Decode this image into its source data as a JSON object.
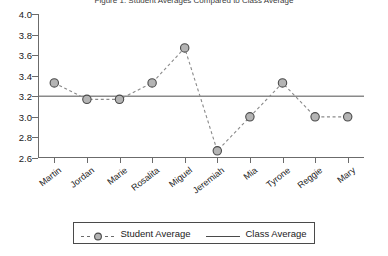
{
  "chart_data": {
    "type": "line",
    "title": "Figure 1. Student Averages Compared to Class Average",
    "categories": [
      "Martin",
      "Jordan",
      "Marie",
      "Rosalita",
      "Miguel",
      "Jeremiah",
      "Mia",
      "Tyrone",
      "Reggie",
      "Mary"
    ],
    "series": [
      {
        "name": "Student Average",
        "style": "dashed-marker",
        "values": [
          3.33,
          3.17,
          3.17,
          3.33,
          3.67,
          2.67,
          3.0,
          3.33,
          3.0,
          3.0
        ]
      },
      {
        "name": "Class Average",
        "style": "solid-line",
        "value": 3.2
      }
    ],
    "xlabel": "",
    "ylabel": "",
    "ylim": [
      2.6,
      4.0
    ],
    "ytick_labels": [
      "4.0",
      "3.8",
      "3.6",
      "3.4",
      "3.2",
      "3.0",
      "2.8",
      "2.6"
    ],
    "ytick_values": [
      4.0,
      3.8,
      3.6,
      3.4,
      3.2,
      3.0,
      2.8,
      2.6
    ],
    "grid": false,
    "legend_position": "bottom",
    "colors": {
      "marker_fill": "#b4b4b4",
      "marker_edge": "#4a4a4a",
      "student_line": "#8a8a8a",
      "class_line": "#8a8a8a",
      "axis": "#6b6b6b",
      "text": "#1a1a1a",
      "background": "#ffffff"
    }
  },
  "legend": {
    "student_label": "Student Average",
    "class_label": "Class Average"
  }
}
